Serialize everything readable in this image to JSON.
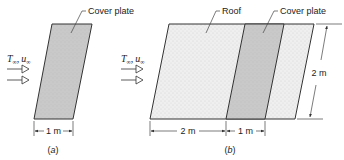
{
  "panels": [
    {
      "id": "a",
      "caption_letter": "a",
      "labels": {
        "cover_plate": "Cover plate"
      },
      "flow": {
        "temp_symbol": "T",
        "temp_sub": "∞",
        "vel_symbol": "u",
        "vel_sub": "∞",
        "separator": ","
      },
      "dimensions": {
        "width": "1 m"
      }
    },
    {
      "id": "b",
      "caption_letter": "b",
      "labels": {
        "roof": "Roof",
        "cover_plate": "Cover plate"
      },
      "flow": {
        "temp_symbol": "T",
        "temp_sub": "∞",
        "vel_symbol": "u",
        "vel_sub": "∞",
        "separator": ","
      },
      "dimensions": {
        "roof_width": "2 m",
        "plate_width": "1 m",
        "height": "2 m"
      }
    }
  ],
  "colors": {
    "cover_plate_fill": "#c8c8c8",
    "roof_fill": "#ececec",
    "line": "#333333"
  }
}
